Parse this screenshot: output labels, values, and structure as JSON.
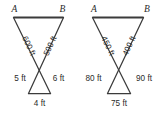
{
  "figures": [
    {
      "name": "left-figure",
      "vertex_top_left": "A",
      "vertex_top_right": "B",
      "upper_left_side": "600 ft",
      "upper_right_side": "500 ft",
      "lower_left_side": "5 ft",
      "lower_right_side": "6 ft",
      "lower_base": "4 ft"
    },
    {
      "name": "right-figure",
      "vertex_top_left": "A",
      "vertex_top_right": "B",
      "upper_left_side": "450 ft",
      "upper_right_side": "400 ft",
      "lower_left_side": "80 ft",
      "lower_right_side": "90 ft",
      "lower_base": "75 ft"
    }
  ],
  "colors": {
    "background": "#ffffff",
    "stroke": "#3b3b3b",
    "text": "#2b2b2b"
  }
}
